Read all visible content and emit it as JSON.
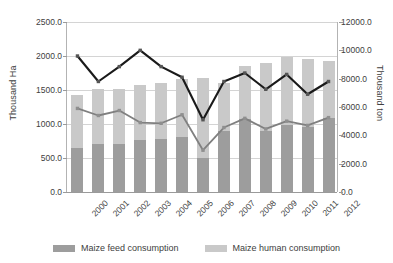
{
  "chart_data": {
    "type": "bar",
    "title": "",
    "subtitle": "",
    "xlabel": "",
    "ylabel": "Thousand Ha",
    "y2label": "Thousand ton",
    "categories": [
      "2000",
      "2001",
      "2002",
      "2003",
      "2004",
      "2005",
      "2006",
      "2007",
      "2008",
      "2009",
      "2010",
      "2011",
      "2012"
    ],
    "ylim": [
      0,
      2500
    ],
    "y2lim": [
      0,
      12000
    ],
    "yticks": [
      "0.0",
      "500.0",
      "1000.0",
      "1500.0",
      "2000.0",
      "2500.0"
    ],
    "y2ticks": [
      "0.0",
      "2000.0",
      "4000.0",
      "6000.0",
      "8000.0",
      "10000.0",
      "12000.0"
    ],
    "ytick_values": [
      0,
      500,
      1000,
      1500,
      2000,
      2500
    ],
    "y2tick_values": [
      0,
      2000,
      4000,
      6000,
      8000,
      10000,
      12000
    ],
    "grid": true,
    "legend_position": "bottom",
    "stacked": true,
    "series": [
      {
        "name": "Maize feed consumption",
        "kind": "bar",
        "axis": "left",
        "color": "#9d9d9d",
        "values": [
          650,
          700,
          710,
          770,
          775,
          810,
          500,
          900,
          1070,
          900,
          990,
          955,
          1085
        ]
      },
      {
        "name": "Maize human consumption",
        "kind": "bar",
        "axis": "left",
        "color": "#c9c9c9",
        "values": [
          780,
          810,
          800,
          800,
          825,
          845,
          1170,
          710,
          790,
          1000,
          990,
          995,
          840
        ]
      },
      {
        "name": "Maize production",
        "kind": "line",
        "axis": "right",
        "color": "#1a1a1a",
        "values": [
          9600,
          7800,
          8850,
          10000,
          8850,
          8100,
          5100,
          7800,
          8400,
          7250,
          8300,
          6900,
          7800
        ]
      },
      {
        "name": "Maize feed use",
        "kind": "line",
        "axis": "right",
        "color": "#808080",
        "values": [
          5900,
          5400,
          5750,
          4900,
          4850,
          5450,
          2950,
          4550,
          5200,
          4450,
          5000,
          4700,
          5250
        ]
      }
    ]
  },
  "legend": {
    "items": [
      {
        "label": "Maize feed consumption",
        "color": "#9d9d9d"
      },
      {
        "label": "Maize human consumption",
        "color": "#c9c9c9"
      }
    ]
  }
}
